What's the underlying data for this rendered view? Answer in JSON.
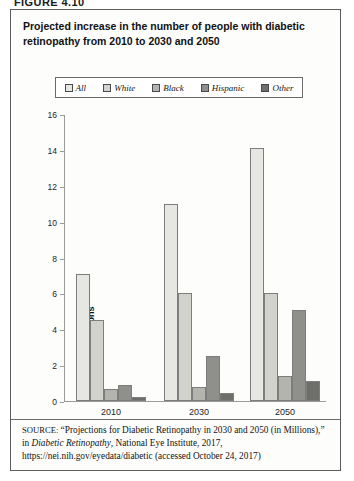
{
  "figure": {
    "label": "FIGURE 4.10",
    "title": "Projected increase in the number of people with diabetic retinopathy from 2010 to 2030 and 2050"
  },
  "legend": {
    "position": "top",
    "items": [
      {
        "label": "All",
        "color": "#e6e6e3"
      },
      {
        "label": "White",
        "color": "#d2d2cd"
      },
      {
        "label": "Black",
        "color": "#b4b4af"
      },
      {
        "label": "Hispanic",
        "color": "#8f8f8b"
      },
      {
        "label": "Other",
        "color": "#6e6e6b"
      }
    ]
  },
  "axis": {
    "y_title": "In millions",
    "y_ticks": [
      "0",
      "2",
      "4",
      "6",
      "8",
      "10",
      "12",
      "14",
      "16"
    ],
    "x_ticks": [
      "2010",
      "2030",
      "2050"
    ]
  },
  "source": {
    "label": "SOURCE:",
    "text_1": " “Projections for Diabetic Retinopathy in 2030 and 2050 (in Millions),” in ",
    "text_italic": "Diabetic Retinopathy",
    "text_2": ", National Eye Institute, 2017, https://nei.nih.gov/eyedata/diabetic (accessed October 24, 2017)"
  },
  "chart_data": {
    "type": "bar",
    "title": "Projected increase in the number of people with diabetic retinopathy from 2010 to 2030 and 2050",
    "xlabel": "",
    "ylabel": "In millions",
    "ylim": [
      0,
      16
    ],
    "ytick_step": 2,
    "grid": false,
    "legend_position": "top",
    "categories": [
      "2010",
      "2030",
      "2050"
    ],
    "series": [
      {
        "name": "All",
        "color": "#e6e6e3",
        "values": [
          7.1,
          11.0,
          14.1
        ]
      },
      {
        "name": "White",
        "color": "#d2d2cd",
        "values": [
          4.5,
          6.0,
          6.0
        ]
      },
      {
        "name": "Black",
        "color": "#b4b4af",
        "values": [
          0.65,
          0.8,
          1.4
        ]
      },
      {
        "name": "Hispanic",
        "color": "#8f8f8b",
        "values": [
          0.9,
          2.5,
          5.1
        ]
      },
      {
        "name": "Other",
        "color": "#6e6e6b",
        "values": [
          0.25,
          0.45,
          1.1
        ]
      }
    ]
  }
}
